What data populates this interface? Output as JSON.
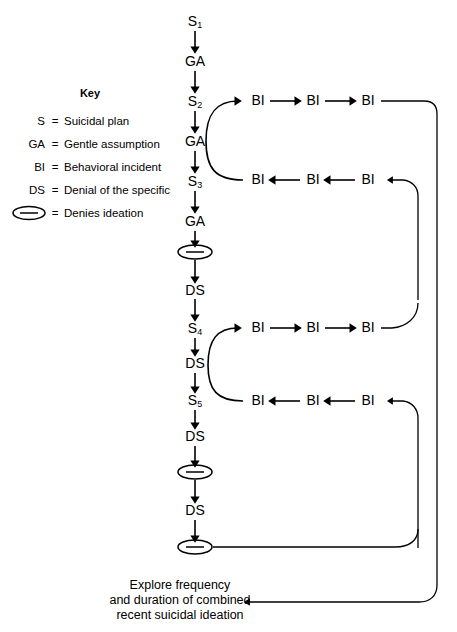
{
  "diagram": {
    "key": {
      "heading": "Key",
      "entries": [
        {
          "abbr": "S",
          "eq": "=",
          "desc": "Suicidal plan"
        },
        {
          "abbr": "GA",
          "eq": "=",
          "desc": "Gentle assumption"
        },
        {
          "abbr": "BI",
          "eq": "=",
          "desc": "Behavioral incident"
        },
        {
          "abbr": "DS",
          "eq": "=",
          "desc": "Denial of the specific"
        },
        {
          "abbr": "",
          "eq": "=",
          "desc": "Denies ideation",
          "icon": "denies-ideation-ellipse"
        }
      ]
    },
    "main_column": [
      {
        "id": "n1",
        "label": "S",
        "sub": "1",
        "type": "text",
        "x": 195,
        "y": 22
      },
      {
        "id": "n2",
        "label": "GA",
        "sub": "",
        "type": "text",
        "x": 195,
        "y": 62
      },
      {
        "id": "n3",
        "label": "S",
        "sub": "2",
        "type": "text",
        "x": 195,
        "y": 102
      },
      {
        "id": "n4",
        "label": "GA",
        "sub": "",
        "type": "text",
        "x": 195,
        "y": 142
      },
      {
        "id": "n5",
        "label": "S",
        "sub": "3",
        "type": "text",
        "x": 195,
        "y": 182
      },
      {
        "id": "n6",
        "label": "GA",
        "sub": "",
        "type": "text",
        "x": 195,
        "y": 222
      },
      {
        "id": "n7",
        "label": "",
        "sub": "",
        "type": "ellipse",
        "x": 195,
        "y": 252
      },
      {
        "id": "n8",
        "label": "DS",
        "sub": "",
        "type": "text",
        "x": 195,
        "y": 291
      },
      {
        "id": "n9",
        "label": "S",
        "sub": "4",
        "type": "text",
        "x": 195,
        "y": 329
      },
      {
        "id": "n10",
        "label": "DS",
        "sub": "",
        "type": "text",
        "x": 195,
        "y": 364
      },
      {
        "id": "n11",
        "label": "S",
        "sub": "5",
        "type": "text",
        "x": 195,
        "y": 401
      },
      {
        "id": "n12",
        "label": "DS",
        "sub": "",
        "type": "text",
        "x": 195,
        "y": 437
      },
      {
        "id": "n13",
        "label": "",
        "sub": "",
        "type": "ellipse",
        "x": 195,
        "y": 472
      },
      {
        "id": "n14",
        "label": "DS",
        "sub": "",
        "type": "text",
        "x": 195,
        "y": 511
      },
      {
        "id": "n15",
        "label": "",
        "sub": "",
        "type": "ellipse",
        "x": 195,
        "y": 547
      }
    ],
    "loops": [
      {
        "id": "loop-1",
        "top_row": [
          {
            "label": "BI",
            "x": 258,
            "y": 101
          },
          {
            "label": "BI",
            "x": 313,
            "y": 101
          },
          {
            "label": "BI",
            "x": 368,
            "y": 101
          }
        ],
        "bottom_row": [
          {
            "label": "BI",
            "x": 258,
            "y": 180
          },
          {
            "label": "BI",
            "x": 313,
            "y": 180
          },
          {
            "label": "BI",
            "x": 368,
            "y": 180
          }
        ]
      },
      {
        "id": "loop-2",
        "top_row": [
          {
            "label": "BI",
            "x": 258,
            "y": 328
          },
          {
            "label": "BI",
            "x": 313,
            "y": 328
          },
          {
            "label": "BI",
            "x": 368,
            "y": 328
          }
        ],
        "bottom_row": [
          {
            "label": "BI",
            "x": 258,
            "y": 401
          },
          {
            "label": "BI",
            "x": 313,
            "y": 401
          },
          {
            "label": "BI",
            "x": 368,
            "y": 401
          }
        ]
      }
    ],
    "outcome": {
      "lines": [
        "Explore frequency",
        "and duration of combined",
        "recent suicidal ideation"
      ]
    },
    "colors": {
      "stroke": "#000000",
      "background": "#ffffff"
    }
  }
}
